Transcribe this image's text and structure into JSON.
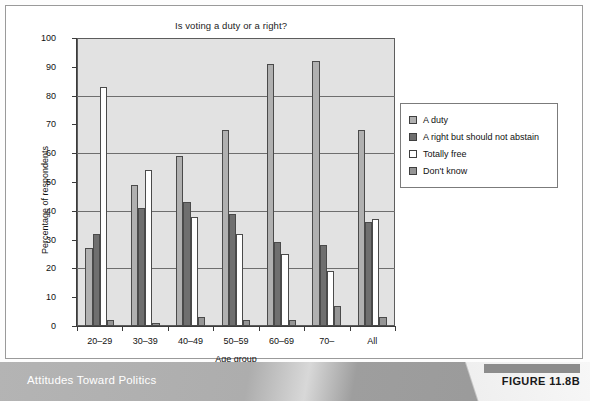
{
  "figure": {
    "footer_title": "Attitudes Toward Politics",
    "badge": "FIGURE 11.8B"
  },
  "chart_data": {
    "type": "bar",
    "title": "Is voting a duty or a right?",
    "xlabel": "Age group",
    "ylabel": "Percentage of respondents",
    "ylim": [
      0,
      100
    ],
    "ytick_step": 10,
    "gridline_step": 20,
    "grid": true,
    "legend_position": "right",
    "categories": [
      "20–29",
      "30–39",
      "40–49",
      "50–59",
      "60–69",
      "70–",
      "All"
    ],
    "ytick_labels": [
      "0",
      "10",
      "20",
      "30",
      "40",
      "50",
      "60",
      "70",
      "80",
      "90",
      "100"
    ],
    "series": [
      {
        "name": "A duty",
        "color": "#b0b0b0",
        "values": [
          27,
          49,
          59,
          68,
          91,
          92,
          68
        ]
      },
      {
        "name": "A right but should not abstain",
        "color": "#6f6f6f",
        "values": [
          32,
          41,
          43,
          39,
          29,
          28,
          36
        ]
      },
      {
        "name": "Totally free",
        "color": "#ffffff",
        "values": [
          83,
          54,
          38,
          32,
          25,
          19,
          37
        ]
      },
      {
        "name": "Don't know",
        "color": "#959595",
        "values": [
          2,
          1,
          3,
          2,
          2,
          7,
          3
        ]
      }
    ]
  }
}
